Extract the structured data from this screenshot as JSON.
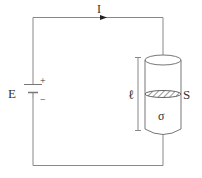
{
  "diagram": {
    "labels": {
      "current": "I",
      "emf": "E",
      "plus": "+",
      "minus": "−",
      "length": "ℓ",
      "cross_section": "S",
      "conductivity": "σ"
    },
    "colors": {
      "wire": "#777777",
      "text": "#333333",
      "hatch": "#555555"
    }
  }
}
